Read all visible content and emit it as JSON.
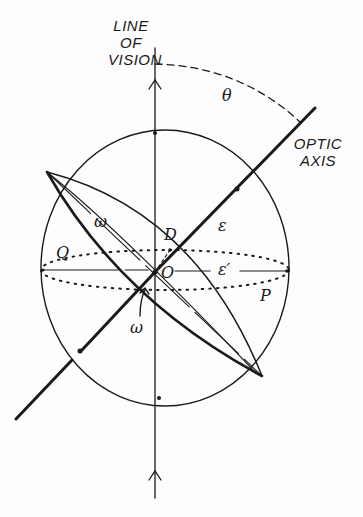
{
  "figure": {
    "type": "index-ellipsoid-diagram",
    "labels": {
      "line_of_vision_1": "LINE",
      "line_of_vision_2": "OF",
      "line_of_vision_3": "VISION",
      "optic_axis_1": "OPTIC",
      "optic_axis_2": "AXIS",
      "theta": "θ",
      "omega_upper": "ω",
      "omega_lower": "ω",
      "epsilon": "ε",
      "epsilon_prime": "ε′",
      "D": "D",
      "O": "O",
      "Q": "Q",
      "P": "P"
    },
    "colors": {
      "ink": "#1a1a1a",
      "background": "#fdfdfd"
    }
  }
}
